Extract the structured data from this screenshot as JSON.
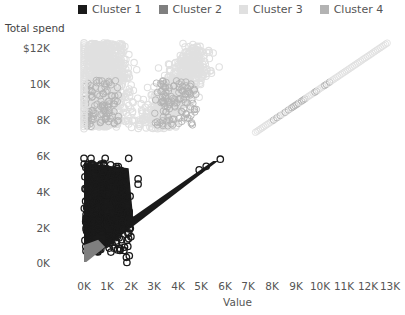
{
  "chart_data": {
    "type": "scatter",
    "title": "",
    "xlabel": "Value",
    "ylabel": "Total spend",
    "xlim": [
      0,
      13000
    ],
    "ylim": [
      0,
      12500
    ],
    "grid": false,
    "legend_position": "top",
    "x_ticks": [
      "0K",
      "1K",
      "2K",
      "3K",
      "4K",
      "5K",
      "6K",
      "7K",
      "8K",
      "9K",
      "10K",
      "11K",
      "12K",
      "13K"
    ],
    "y_ticks": [
      "0K",
      "2K",
      "4K",
      "6K",
      "8K",
      "10K",
      "$12K"
    ],
    "series": [
      {
        "name": "Cluster 1",
        "color": "#1a1a1a",
        "description": "Dense triangle from value 0-2K at spend 0.5K-5.5K, plus a diagonal band spend≈value up to ~6K",
        "points": [
          [
            0,
            500
          ],
          [
            0,
            5800
          ],
          [
            300,
            5800
          ],
          [
            700,
            5800
          ],
          [
            1000,
            5400
          ],
          [
            1500,
            5300
          ],
          [
            1900,
            4500
          ],
          [
            2300,
            4700
          ],
          [
            2000,
            2000
          ],
          [
            3000,
            3000
          ],
          [
            4000,
            4000
          ],
          [
            5000,
            5000
          ],
          [
            5800,
            5800
          ]
        ]
      },
      {
        "name": "Cluster 2",
        "color": "#7f7f7f",
        "description": "Small band near origin, value 0-1K, spend 0-1K",
        "points": [
          [
            0,
            0
          ],
          [
            0,
            800
          ],
          [
            500,
            500
          ],
          [
            900,
            900
          ]
        ]
      },
      {
        "name": "Cluster 3",
        "color": "#e0e0e0",
        "description": "Two clouds at spend 7.5K-12.5K (value 0-2.5K and 3K-5K) plus a diagonal line to 13K",
        "points": [
          [
            0,
            7500
          ],
          [
            0,
            12300
          ],
          [
            800,
            12200
          ],
          [
            1500,
            11500
          ],
          [
            2300,
            10500
          ],
          [
            3000,
            7500
          ],
          [
            3800,
            12300
          ],
          [
            4500,
            11500
          ],
          [
            5200,
            9000
          ],
          [
            7300,
            7300
          ],
          [
            9000,
            9000
          ],
          [
            11000,
            11000
          ],
          [
            12900,
            12300
          ]
        ]
      },
      {
        "name": "Cluster 4",
        "color": "#b3b3b3",
        "description": "Overlaps Cluster 3 clouds and diagonal line, spend 7.5K-10K",
        "points": [
          [
            300,
            8000
          ],
          [
            1000,
            8500
          ],
          [
            3800,
            8000
          ],
          [
            8500,
            8500
          ],
          [
            9500,
            9500
          ]
        ]
      }
    ]
  },
  "legend": {
    "items": [
      {
        "label": "Cluster 1",
        "color": "#1a1a1a"
      },
      {
        "label": "Cluster 2",
        "color": "#7f7f7f"
      },
      {
        "label": "Cluster 3",
        "color": "#e0e0e0"
      },
      {
        "label": "Cluster 4",
        "color": "#b3b3b3"
      }
    ]
  },
  "axes": {
    "y_title": "Total spend",
    "x_title": "Value",
    "y_ticks": [
      {
        "label": "$12K",
        "y": 48
      },
      {
        "label": "10K",
        "y": 84
      },
      {
        "label": "8K",
        "y": 120
      },
      {
        "label": "6K",
        "y": 156
      },
      {
        "label": "4K",
        "y": 192
      },
      {
        "label": "2K",
        "y": 228
      },
      {
        "label": "0K",
        "y": 263
      }
    ],
    "x_ticks": [
      {
        "label": "0K",
        "x": 84
      },
      {
        "label": "1K",
        "x": 107
      },
      {
        "label": "2K",
        "x": 131
      },
      {
        "label": "3K",
        "x": 154
      },
      {
        "label": "4K",
        "x": 178
      },
      {
        "label": "5K",
        "x": 201
      },
      {
        "label": "6K",
        "x": 225
      },
      {
        "label": "7K",
        "x": 248
      },
      {
        "label": "8K",
        "x": 272
      },
      {
        "label": "9K",
        "x": 296
      },
      {
        "label": "10K",
        "x": 320
      },
      {
        "label": "11K",
        "x": 344
      },
      {
        "label": "12K",
        "x": 368
      },
      {
        "label": "13K",
        "x": 390
      }
    ]
  }
}
